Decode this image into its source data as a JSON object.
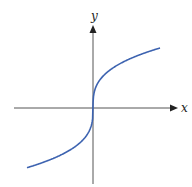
{
  "chart_data": {
    "type": "line",
    "title": "",
    "xlabel": "x",
    "ylabel": "y",
    "function": "y = cube_root(x)",
    "grid": false,
    "legend": null,
    "ticks": "none",
    "series": [
      {
        "name": "curve",
        "color": "#3d63b0",
        "x": [
          -66,
          -40,
          -20,
          -8,
          -2,
          0,
          2,
          8,
          20,
          40,
          67
        ],
        "y": [
          -60,
          -50.6,
          -40.2,
          -29.6,
          -18.6,
          0,
          18.6,
          29.6,
          40.2,
          50.6,
          60
        ]
      }
    ],
    "axes": {
      "color": "#555555",
      "origin_px": [
        93,
        108
      ],
      "x_range_px": [
        14,
        178
      ],
      "y_range_px": [
        25,
        184
      ]
    }
  },
  "labels": {
    "x_axis": "x",
    "y_axis": "y"
  }
}
